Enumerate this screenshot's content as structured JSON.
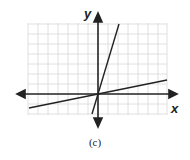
{
  "figure": {
    "caption": "(c)",
    "x_axis_label": "x",
    "y_axis_label": "y",
    "grid": {
      "columns": 14,
      "rows": 9,
      "color": "#d8d8d8"
    },
    "axis_color": "#222222",
    "lines": [
      {
        "name": "steep-line",
        "description": "steep line through origin, positive slope",
        "color": "#222222"
      },
      {
        "name": "shallow-line",
        "description": "shallow line through origin, positive slope",
        "color": "#222222"
      }
    ]
  }
}
